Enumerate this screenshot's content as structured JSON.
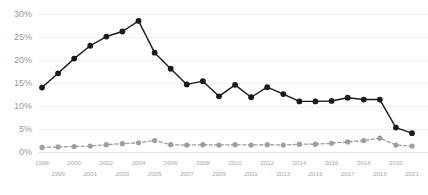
{
  "chart_data": {
    "type": "line",
    "title": "",
    "subtitle": "",
    "xlabel": "",
    "ylabel": "",
    "ylim": [
      0,
      30
    ],
    "y_ticks": [
      0,
      5,
      10,
      15,
      20,
      25,
      30
    ],
    "y_tick_labels": [
      "0%",
      "5%",
      "10%",
      "15%",
      "20%",
      "25%",
      "30%"
    ],
    "grid": true,
    "legend_position": "none",
    "x": [
      1998,
      1999,
      2000,
      2001,
      2002,
      2003,
      2004,
      2005,
      2006,
      2007,
      2008,
      2009,
      2010,
      2011,
      2012,
      2013,
      2014,
      2015,
      2016,
      2017,
      2018,
      2019,
      2020,
      2021
    ],
    "categories": [
      "1998",
      "1999",
      "2000",
      "2001",
      "2002",
      "2003",
      "2004",
      "2005",
      "2006",
      "2007",
      "2008",
      "2009",
      "2010",
      "2011",
      "2012",
      "2013",
      "2014",
      "2015",
      "2016",
      "2017",
      "2018",
      "2019",
      "2020",
      "2021"
    ],
    "x_tick_labels_top": [
      "1998",
      "2000",
      "2002",
      "2004",
      "2006",
      "2008",
      "2010",
      "2012",
      "2014",
      "2016",
      "2018",
      "2020"
    ],
    "x_tick_labels_bottom": [
      "1999",
      "2001",
      "2003",
      "2005",
      "2007",
      "2009",
      "2011",
      "2013",
      "2015",
      "2017",
      "2019",
      "2021"
    ],
    "series": [
      {
        "name": "primary",
        "style": "solid",
        "color": "#1a1a1a",
        "values": [
          14.0,
          17.1,
          20.3,
          23.1,
          25.1,
          26.2,
          28.5,
          21.6,
          18.1,
          14.7,
          15.4,
          12.1,
          14.6,
          11.9,
          14.1,
          12.6,
          11.0,
          11.0,
          11.1,
          11.8,
          11.4,
          11.4,
          5.3,
          4.1
        ]
      },
      {
        "name": "secondary",
        "style": "dashed",
        "color": "#9e9e9e",
        "values": [
          1.0,
          1.1,
          1.2,
          1.3,
          1.6,
          1.8,
          2.0,
          2.5,
          1.6,
          1.5,
          1.6,
          1.5,
          1.6,
          1.5,
          1.6,
          1.5,
          1.7,
          1.7,
          1.9,
          2.2,
          2.5,
          3.0,
          1.5,
          1.3
        ]
      }
    ]
  },
  "axes": {
    "y_axis_name": "percent-axis",
    "x_axis_name": "year-axis"
  }
}
